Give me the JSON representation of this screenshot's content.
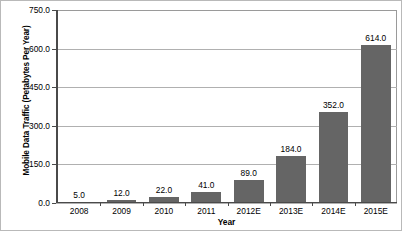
{
  "chart_data": {
    "type": "bar",
    "title": "",
    "xlabel": "Year",
    "ylabel": "Mobile Data Traffic (Petabytes Per Year)",
    "categories": [
      "2008",
      "2009",
      "2010",
      "2011",
      "2012E",
      "2013E",
      "2014E",
      "2015E"
    ],
    "values": [
      5.0,
      12.0,
      22.0,
      41.0,
      89.0,
      184.0,
      352.0,
      614.0
    ],
    "value_labels": [
      "5.0",
      "12.0",
      "22.0",
      "41.0",
      "89.0",
      "184.0",
      "352.0",
      "614.0"
    ],
    "ylim": [
      0,
      750
    ],
    "yticks": [
      0,
      150,
      300,
      450,
      600,
      750
    ],
    "ytick_labels": [
      "0.0",
      "150.0",
      "300.0",
      "450.0",
      "600.0",
      "750.0"
    ],
    "grid": true,
    "legend": false,
    "bar_color": "#656565",
    "gridline_color": "#b0b0b0",
    "axis_color": "#4a4a4a",
    "background_color": "#ffffff"
  }
}
